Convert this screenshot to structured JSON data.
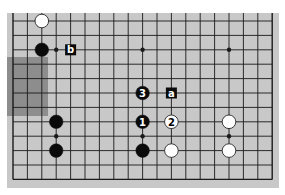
{
  "diagram": {
    "type": "go-board-fragment",
    "colors": {
      "board": "#c8c8c8",
      "shade": "#7a7a7a",
      "line": "#1a1a1a",
      "black_stone": "#0a0a0a",
      "white_stone": "#ffffff",
      "label_bg": "#0a0a0a",
      "label_fg": "#ffffff"
    },
    "grid": {
      "columns": 19,
      "rows": 12,
      "x0": 13,
      "y0": 21,
      "spacing": 14.4,
      "top_edge_open": true
    },
    "shaded_region": {
      "x": 7,
      "y": 57,
      "width": 41,
      "height": 59
    },
    "star_points": [
      {
        "col": 3,
        "row": 2
      },
      {
        "col": 9,
        "row": 2
      },
      {
        "col": 15,
        "row": 2
      },
      {
        "col": 3,
        "row": 8
      },
      {
        "col": 9,
        "row": 8
      },
      {
        "col": 15,
        "row": 8
      }
    ],
    "stones": [
      {
        "color": "white",
        "col": 2,
        "row": 0,
        "label": ""
      },
      {
        "color": "black",
        "col": 2,
        "row": 2,
        "label": ""
      },
      {
        "color": "black",
        "col": 9,
        "row": 5,
        "label": "3"
      },
      {
        "color": "black",
        "col": 9,
        "row": 7,
        "label": "1"
      },
      {
        "color": "white",
        "col": 11,
        "row": 7,
        "label": "2"
      },
      {
        "color": "black",
        "col": 3,
        "row": 7,
        "label": ""
      },
      {
        "color": "white",
        "col": 15,
        "row": 7,
        "label": ""
      },
      {
        "color": "black",
        "col": 3,
        "row": 9,
        "label": ""
      },
      {
        "color": "black",
        "col": 9,
        "row": 9,
        "label": ""
      },
      {
        "color": "white",
        "col": 11,
        "row": 9,
        "label": ""
      },
      {
        "color": "white",
        "col": 15,
        "row": 9,
        "label": ""
      }
    ],
    "markers": [
      {
        "label": "b",
        "col": 4,
        "row": 2
      },
      {
        "label": "a",
        "col": 11,
        "row": 5
      }
    ]
  }
}
